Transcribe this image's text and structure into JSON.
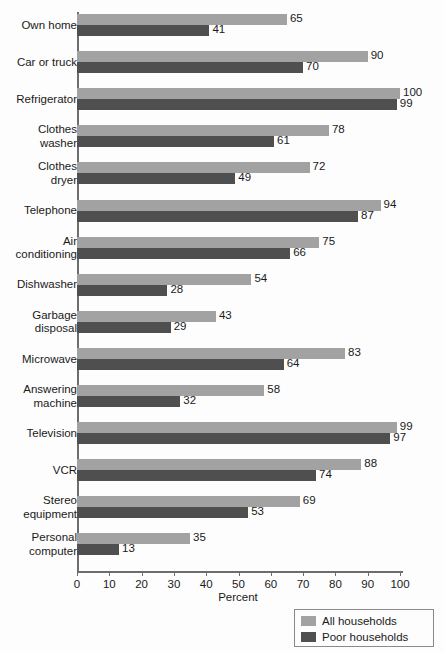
{
  "chart_data": {
    "type": "bar",
    "orientation": "horizontal",
    "title": "",
    "subtitle": "",
    "xlabel": "Percent",
    "ylabel": "",
    "xlim": [
      0,
      105
    ],
    "xticks": [
      0,
      10,
      20,
      30,
      40,
      50,
      60,
      70,
      80,
      90,
      100
    ],
    "grid": false,
    "legend_position": "bottom-right",
    "categories": [
      "Own home",
      "Car or truck",
      "Refrigerator",
      "Clothes\nwasher",
      "Clothes\ndryer",
      "Telephone",
      "Air\nconditioning",
      "Dishwasher",
      "Garbage\ndisposal",
      "Microwave",
      "Answering\nmachine",
      "Television",
      "VCR",
      "Stereo\nequipment",
      "Personal\ncomputer"
    ],
    "series": [
      {
        "name": "All households",
        "color": "#a2a2a2",
        "values": [
          65,
          90,
          100,
          78,
          72,
          94,
          75,
          54,
          43,
          83,
          58,
          99,
          88,
          69,
          35
        ]
      },
      {
        "name": "Poor households",
        "color": "#4f4f4f",
        "values": [
          41,
          70,
          99,
          61,
          49,
          87,
          66,
          28,
          29,
          64,
          32,
          97,
          74,
          53,
          13
        ]
      }
    ]
  },
  "axis": {
    "x_title": "Percent",
    "tick_labels": [
      "0",
      "10",
      "20",
      "30",
      "40",
      "50",
      "60",
      "70",
      "80",
      "90",
      "100"
    ]
  },
  "legend": {
    "items": [
      {
        "label": "All households",
        "color": "#a2a2a2"
      },
      {
        "label": "Poor households",
        "color": "#4f4f4f"
      }
    ]
  }
}
